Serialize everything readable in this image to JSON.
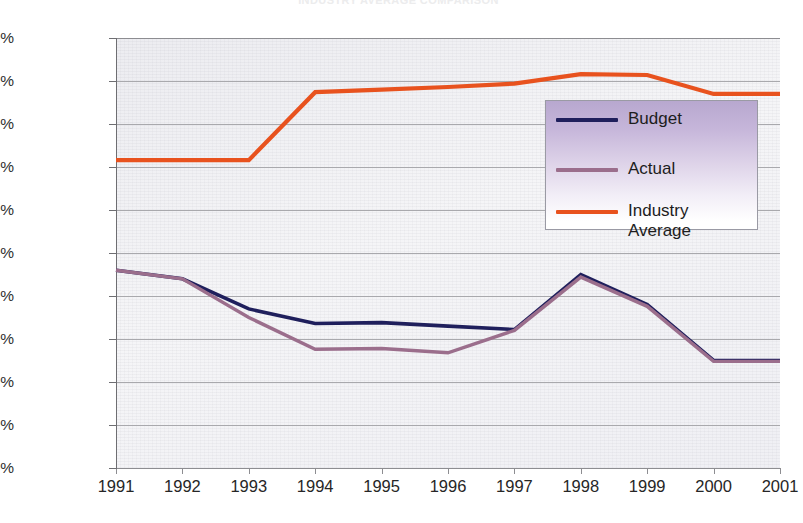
{
  "chart_data": {
    "type": "line",
    "title": "INDUSTRY AVERAGE COMPARISON",
    "xlabel": "",
    "ylabel": "",
    "categories": [
      "1991",
      "1992",
      "1993",
      "1994",
      "1995",
      "1996",
      "1997",
      "1998",
      "1999",
      "2000",
      "2001"
    ],
    "x": [
      1991,
      1992,
      1993,
      1994,
      1995,
      1996,
      1997,
      1998,
      1999,
      2000,
      2001
    ],
    "ylim": [
      0.0,
      0.05
    ],
    "y_tick_values": [
      0.05,
      0.045,
      0.04,
      0.035,
      0.03,
      0.025,
      0.02,
      0.015,
      0.01,
      0.005,
      0.0
    ],
    "y_tick_labels": [
      "0.0500%",
      "0.0450%",
      "0.0400%",
      "0.0350%",
      "0.0300%",
      "0.0250%",
      "0.0200%",
      "0.0150%",
      "0.0100%",
      "0.0050%",
      "0.0000%"
    ],
    "grid": true,
    "grid_axis": "y",
    "legend_position": "upper right",
    "series": [
      {
        "name": "Budget",
        "color": "#1f1f5c",
        "values": [
          0.023,
          0.022,
          0.0185,
          0.0168,
          0.0169,
          0.0165,
          0.0161,
          0.0225,
          0.019,
          0.0125,
          0.0125
        ]
      },
      {
        "name": "Actual",
        "color": "#9b6e8c",
        "values": [
          0.023,
          0.022,
          0.0175,
          0.0138,
          0.0139,
          0.0134,
          0.016,
          0.0222,
          0.0188,
          0.0124,
          0.0124
        ]
      },
      {
        "name": "Industry\nAverage",
        "color": "#e8521e",
        "values": [
          0.0358,
          0.0358,
          0.0358,
          0.0437,
          0.044,
          0.0443,
          0.0447,
          0.0458,
          0.0457,
          0.0435,
          0.0435
        ]
      }
    ]
  },
  "legend": {
    "entries": [
      {
        "label": "Budget",
        "swatch_color": "#1f1f5c"
      },
      {
        "label": "Actual",
        "swatch_color": "#9b6e8c"
      },
      {
        "label": "Industry\nAverage",
        "swatch_color": "#e8521e"
      }
    ]
  }
}
